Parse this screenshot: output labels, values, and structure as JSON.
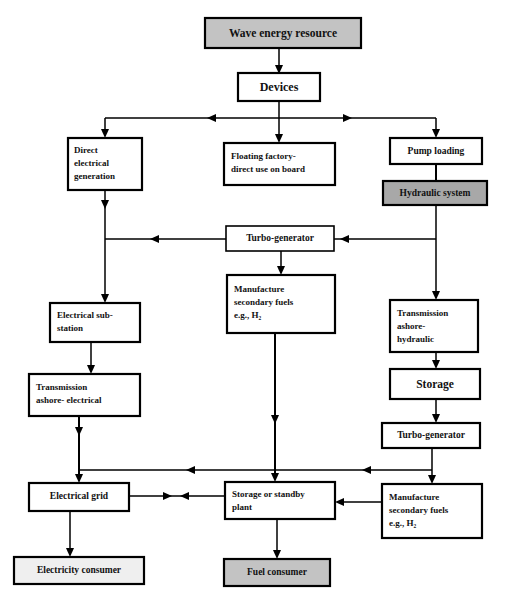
{
  "diagram": {
    "canvas": {
      "width": 514,
      "height": 609
    },
    "colors": {
      "fill_gray": "#c3c3c3",
      "fill_dark_gray": "#a8a8a8",
      "fill_light_gray": "#efefef",
      "fill_white": "#ffffff",
      "stroke": "#000000",
      "text": "#111111"
    },
    "nodes": [
      {
        "id": "wave-energy-resource",
        "label": "Wave energy resource",
        "lines": [
          "Wave energy resource"
        ],
        "fill": "#c3c3c3",
        "x": 205,
        "y": 18,
        "w": 156,
        "h": 30,
        "align": "center",
        "font_size": 11.5,
        "border": "thick"
      },
      {
        "id": "devices",
        "label": "Devices",
        "lines": [
          "Devices"
        ],
        "fill": "#ffffff",
        "x": 238,
        "y": 73,
        "w": 82,
        "h": 28,
        "align": "center",
        "font_size": 12,
        "border": "thick"
      },
      {
        "id": "direct-electrical-generation",
        "label": "Direct electrical generation",
        "lines": [
          "Direct",
          "electrical",
          "generation"
        ],
        "fill": "#ffffff",
        "x": 68,
        "y": 138,
        "w": 74,
        "h": 52,
        "align": "left",
        "font_size": 9,
        "border": "thick"
      },
      {
        "id": "floating-factory",
        "label": "Floating factory- direct use on board",
        "lines": [
          "Floating factory-",
          "direct use on board"
        ],
        "fill": "#ffffff",
        "x": 224,
        "y": 143,
        "w": 111,
        "h": 42,
        "align": "left",
        "font_size": 9,
        "border": "thick"
      },
      {
        "id": "pump-loading",
        "label": "Pump loading",
        "lines": [
          "Pump loading"
        ],
        "fill": "#ffffff",
        "x": 390,
        "y": 138,
        "w": 92,
        "h": 26,
        "align": "center",
        "font_size": 9.5,
        "border": "thick"
      },
      {
        "id": "hydraulic-system",
        "label": "Hydraulic system",
        "lines": [
          "Hydraulic system"
        ],
        "fill": "#a8a8a8",
        "x": 383,
        "y": 181,
        "w": 104,
        "h": 24,
        "align": "center",
        "font_size": 9.5,
        "border": "thick"
      },
      {
        "id": "turbo-generator-mid",
        "label": "Turbo-generator",
        "lines": [
          "Turbo-generator"
        ],
        "fill": "#ffffff",
        "x": 226,
        "y": 226,
        "w": 108,
        "h": 25,
        "align": "center",
        "font_size": 9.5,
        "border": "thin"
      },
      {
        "id": "manufacture-secondary-fuels-mid",
        "label": "Manufacture secondary fuels e.g., H2",
        "lines": [
          "Manufacture",
          "secondary fuels",
          "e.g., H₂"
        ],
        "fill": "#ffffff",
        "x": 227,
        "y": 275,
        "w": 108,
        "h": 58,
        "align": "left",
        "font_size": 9,
        "border": "thick"
      },
      {
        "id": "electrical-sub-station",
        "label": "Electrical sub-station",
        "lines": [
          "Electrical sub-",
          "station"
        ],
        "fill": "#ffffff",
        "x": 50,
        "y": 303,
        "w": 90,
        "h": 39,
        "align": "left",
        "font_size": 9,
        "border": "thick"
      },
      {
        "id": "transmission-ashore-electrical",
        "label": "Transmission ashore- electrical",
        "lines": [
          "Transmission",
          "ashore- electrical"
        ],
        "fill": "#ffffff",
        "x": 29,
        "y": 374,
        "w": 111,
        "h": 42,
        "align": "left",
        "font_size": 9,
        "border": "thick"
      },
      {
        "id": "transmission-ashore-hydraulic",
        "label": "Transmission ashore- hydraulic",
        "lines": [
          "Transmission",
          "ashore-",
          "hydraulic"
        ],
        "fill": "#ffffff",
        "x": 390,
        "y": 300,
        "w": 88,
        "h": 52,
        "align": "left",
        "font_size": 9,
        "border": "thick"
      },
      {
        "id": "storage",
        "label": "Storage",
        "lines": [
          "Storage"
        ],
        "fill": "#ffffff",
        "x": 390,
        "y": 369,
        "w": 90,
        "h": 30,
        "align": "center",
        "font_size": 11.5,
        "border": "thick"
      },
      {
        "id": "turbo-generator-right",
        "label": "Turbo-generator",
        "lines": [
          "Turbo-generator"
        ],
        "fill": "#ffffff",
        "x": 382,
        "y": 423,
        "w": 98,
        "h": 25,
        "align": "center",
        "font_size": 9.5,
        "border": "thick"
      },
      {
        "id": "electrical-grid",
        "label": "Electrical grid",
        "lines": [
          "Electrical grid"
        ],
        "fill": "#ffffff",
        "x": 29,
        "y": 483,
        "w": 100,
        "h": 28,
        "align": "center",
        "font_size": 9.5,
        "border": "thick"
      },
      {
        "id": "storage-or-standby-plant",
        "label": "Storage or standby plant",
        "lines": [
          "Storage or standby",
          "plant"
        ],
        "fill": "#ffffff",
        "x": 225,
        "y": 482,
        "w": 110,
        "h": 37,
        "align": "left",
        "font_size": 9,
        "border": "thick"
      },
      {
        "id": "manufacture-secondary-fuels-right",
        "label": "Manufacture secondary fuels e.g., H2",
        "lines": [
          "Manufacture",
          "secondary fuels",
          "e.g., H₂"
        ],
        "fill": "#ffffff",
        "x": 382,
        "y": 484,
        "w": 100,
        "h": 54,
        "align": "left",
        "font_size": 9,
        "border": "thick"
      },
      {
        "id": "electricity-consumer",
        "label": "Electricity consumer",
        "lines": [
          "Electricity consumer"
        ],
        "fill": "#efefef",
        "x": 14,
        "y": 557,
        "w": 130,
        "h": 27,
        "align": "center",
        "font_size": 9.5,
        "border": "thick"
      },
      {
        "id": "fuel-consumer",
        "label": "Fuel consumer",
        "lines": [
          "Fuel consumer"
        ],
        "fill": "#c3c3c3",
        "x": 224,
        "y": 559,
        "w": 106,
        "h": 27,
        "align": "center",
        "font_size": 9.5,
        "border": "thick"
      }
    ],
    "edges": [
      {
        "id": "wave-to-devices",
        "from": "wave-energy-resource",
        "to": "devices"
      },
      {
        "id": "devices-to-bus",
        "from": "devices",
        "to": "distribution-bus"
      },
      {
        "id": "bus-to-direct-electrical",
        "from": "distribution-bus",
        "to": "direct-electrical-generation"
      },
      {
        "id": "bus-to-floating-factory",
        "from": "distribution-bus",
        "to": "floating-factory"
      },
      {
        "id": "bus-to-pump-loading",
        "from": "distribution-bus",
        "to": "pump-loading"
      },
      {
        "id": "pump-to-hydraulic",
        "from": "pump-loading",
        "to": "hydraulic-system"
      },
      {
        "id": "hydraulic-to-turbo-mid",
        "from": "hydraulic-system",
        "to": "turbo-generator-mid"
      },
      {
        "id": "hydraulic-to-transmission-hydraulic",
        "from": "hydraulic-system",
        "to": "transmission-ashore-hydraulic"
      },
      {
        "id": "turbo-mid-to-substation-column",
        "from": "turbo-generator-mid",
        "to": "electrical-sub-station"
      },
      {
        "id": "turbo-mid-to-manufacture-mid",
        "from": "turbo-generator-mid",
        "to": "manufacture-secondary-fuels-mid"
      },
      {
        "id": "direct-electrical-to-substation",
        "from": "direct-electrical-generation",
        "to": "electrical-sub-station"
      },
      {
        "id": "substation-to-transmission-electrical",
        "from": "electrical-sub-station",
        "to": "transmission-ashore-electrical"
      },
      {
        "id": "transmission-electrical-to-grid",
        "from": "transmission-ashore-electrical",
        "to": "electrical-grid"
      },
      {
        "id": "transmission-hydraulic-to-storage",
        "from": "transmission-ashore-hydraulic",
        "to": "storage"
      },
      {
        "id": "storage-to-turbo-right",
        "from": "storage",
        "to": "turbo-generator-right"
      },
      {
        "id": "turbo-right-to-bus",
        "from": "turbo-generator-right",
        "to": "lower-bus"
      },
      {
        "id": "turbo-right-to-manufacture-right",
        "from": "turbo-generator-right",
        "to": "manufacture-secondary-fuels-right"
      },
      {
        "id": "manufacture-mid-to-standby",
        "from": "manufacture-secondary-fuels-mid",
        "to": "storage-or-standby-plant"
      },
      {
        "id": "manufacture-right-to-standby",
        "from": "manufacture-secondary-fuels-right",
        "to": "storage-or-standby-plant"
      },
      {
        "id": "lower-bus-to-grid",
        "from": "lower-bus",
        "to": "electrical-grid"
      },
      {
        "id": "lower-bus-to-standby",
        "from": "lower-bus",
        "to": "storage-or-standby-plant"
      },
      {
        "id": "grid-to-standby",
        "from": "electrical-grid",
        "to": "storage-or-standby-plant"
      },
      {
        "id": "grid-to-electricity-consumer",
        "from": "electrical-grid",
        "to": "electricity-consumer"
      },
      {
        "id": "standby-to-fuel-consumer",
        "from": "storage-or-standby-plant",
        "to": "fuel-consumer"
      }
    ]
  }
}
